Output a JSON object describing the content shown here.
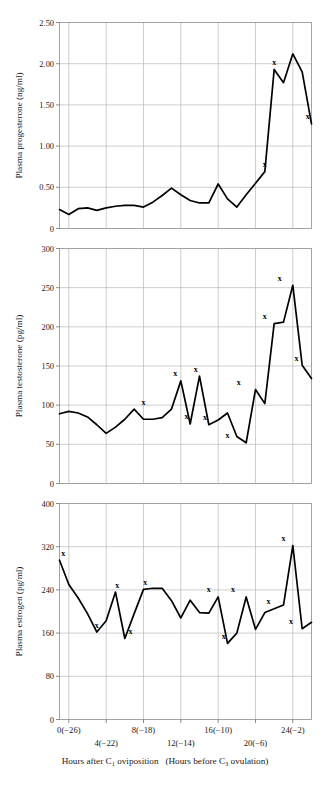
{
  "figure": {
    "width": 330,
    "height": 790,
    "background": "#ffffff",
    "line_color": "#000000",
    "grid_color": "#b9b9b9",
    "frame_color": "#9a9a9a",
    "marker_glyph": "x"
  },
  "xaxis": {
    "label_row1": [
      {
        "text": "0(−26)",
        "hour": 0
      },
      {
        "text": "8(−18)",
        "hour": 8
      },
      {
        "text": "16(−10)",
        "hour": 16
      },
      {
        "text": "24(−2)",
        "hour": 24
      }
    ],
    "label_row2": [
      {
        "text": "4(−22)",
        "hour": 4
      },
      {
        "text": "12(−14)",
        "hour": 12
      },
      {
        "text": "20(−6)",
        "hour": 20
      }
    ],
    "caption_part1": "Hours after C",
    "caption_sub1": "1",
    "caption_part2": " oviposition",
    "caption_part3": "(Hours before C",
    "caption_sub2": "3",
    "caption_part4": " ovulation)",
    "range": [
      -1,
      26
    ],
    "gridline_hours": [
      0,
      4,
      8,
      12,
      16,
      20,
      24
    ]
  },
  "chart_data": [
    {
      "type": "line",
      "title": "",
      "panel": "progesterone",
      "ylabel": "Plasma progesterone (ng/ml)",
      "xlabel": "",
      "units": "ng/ml",
      "ylim": [
        0,
        2.5
      ],
      "yticks": [
        0,
        0.5,
        1.0,
        1.5,
        2.0,
        2.5
      ],
      "ytick_labels": [
        "0",
        "0.50",
        "1.00",
        "1.50",
        "2.00",
        "2.50"
      ],
      "grid": true,
      "legend": "none",
      "x": [
        -1,
        0,
        1,
        2,
        3,
        4,
        5,
        6,
        7,
        8,
        9,
        10,
        11,
        12,
        13,
        14,
        15,
        16,
        17,
        18,
        19,
        20,
        21,
        22,
        23,
        24,
        25
      ],
      "values": [
        0.23,
        0.17,
        0.24,
        0.25,
        0.22,
        0.25,
        0.27,
        0.28,
        0.28,
        0.26,
        0.32,
        0.4,
        0.49,
        0.41,
        0.34,
        0.31,
        0.31,
        0.54,
        0.36,
        0.26,
        0.41,
        0.55,
        0.69,
        1.93,
        1.77,
        2.12,
        1.9,
        1.27
      ],
      "marked_indices": [
        22,
        23,
        27
      ],
      "marked_points": [
        {
          "x": 21,
          "y": 0.69
        },
        {
          "x": 22,
          "y": 1.93
        },
        {
          "x": 25.6,
          "y": 1.27
        }
      ]
    },
    {
      "type": "line",
      "title": "",
      "panel": "testosterone",
      "ylabel": "Plasma testosterone (pg/ml)",
      "xlabel": "",
      "units": "pg/ml",
      "ylim": [
        0,
        300
      ],
      "yticks": [
        0,
        50,
        100,
        150,
        200,
        250,
        300
      ],
      "ytick_labels": [
        "0",
        "50",
        "100",
        "150",
        "200",
        "250",
        "300"
      ],
      "grid": true,
      "legend": "none",
      "x": [
        -1,
        0,
        1,
        2,
        3,
        4,
        5,
        6,
        7,
        8,
        9,
        10,
        11,
        12,
        13,
        14,
        15,
        16,
        17,
        18,
        19,
        20,
        21,
        22,
        23,
        24,
        25
      ],
      "values": [
        89,
        92,
        90,
        85,
        75,
        64,
        72,
        82,
        95,
        82,
        82,
        84,
        95,
        131,
        76,
        137,
        75,
        81,
        90,
        60,
        52,
        120,
        102,
        204,
        206,
        253,
        151,
        134
      ],
      "marked_points": [
        {
          "x": 8.0,
          "y": 95
        },
        {
          "x": 11.4,
          "y": 131
        },
        {
          "x": 12.6,
          "y": 76
        },
        {
          "x": 13.6,
          "y": 137
        },
        {
          "x": 14.6,
          "y": 75
        },
        {
          "x": 17.0,
          "y": 52
        },
        {
          "x": 18.2,
          "y": 120
        },
        {
          "x": 21.0,
          "y": 204
        },
        {
          "x": 22.6,
          "y": 253
        },
        {
          "x": 24.4,
          "y": 151
        }
      ]
    },
    {
      "type": "line",
      "title": "",
      "panel": "estrogen",
      "ylabel": "Plasma estrogen (pg/ml)",
      "xlabel": "",
      "units": "pg/ml",
      "ylim": [
        0,
        400
      ],
      "yticks": [
        0,
        80,
        160,
        240,
        320,
        400
      ],
      "ytick_labels": [
        "0",
        "80",
        "160",
        "240",
        "320",
        "400"
      ],
      "grid": true,
      "legend": "none",
      "x": [
        -1,
        0,
        1,
        2,
        3,
        4,
        5,
        6,
        7,
        8,
        9,
        10,
        11,
        12,
        13,
        14,
        15,
        16,
        17,
        18,
        19,
        20,
        21,
        22,
        23,
        24,
        25
      ],
      "values": [
        295,
        250,
        225,
        196,
        162,
        183,
        236,
        150,
        196,
        241,
        243,
        243,
        220,
        188,
        221,
        198,
        197,
        227,
        141,
        160,
        227,
        167,
        198,
        205,
        212,
        322,
        168,
        180
      ],
      "marked_points": [
        {
          "x": -0.6,
          "y": 295
        },
        {
          "x": 3.0,
          "y": 162
        },
        {
          "x": 5.2,
          "y": 236
        },
        {
          "x": 6.6,
          "y": 150
        },
        {
          "x": 8.2,
          "y": 241
        },
        {
          "x": 15.0,
          "y": 227
        },
        {
          "x": 16.6,
          "y": 141
        },
        {
          "x": 17.6,
          "y": 227
        },
        {
          "x": 21.4,
          "y": 205
        },
        {
          "x": 23.0,
          "y": 322
        },
        {
          "x": 23.8,
          "y": 168
        }
      ]
    }
  ]
}
